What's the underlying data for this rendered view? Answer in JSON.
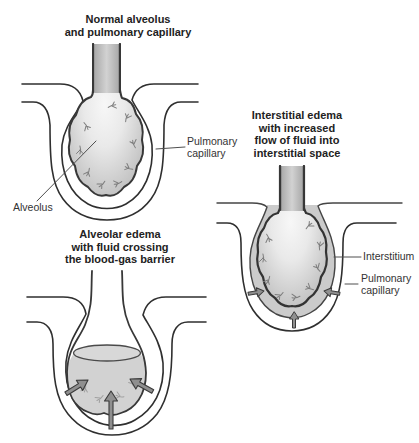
{
  "figure_type": "medical illustration, pulmonary edema stages",
  "colors": {
    "background": "#ffffff",
    "outline": "#333333",
    "title_text": "#222222",
    "label_text": "#333333",
    "alveolus_center": "#f7f7f7",
    "alveolus_edge": "#c2c2c2",
    "stalk_gray": "#b9b9b9",
    "interstitium_fill": "#cbcbcb",
    "fluid_fill": "#d2d2d2",
    "arrow_fill": "#8f8f8f"
  },
  "panels": {
    "normal": {
      "title": "Normal alveolus\nand pulmonary capillary",
      "labels": {
        "alveolus": "Alveolus",
        "pulmonary_capillary": "Pulmonary\ncapillary"
      }
    },
    "interstitial": {
      "title": "Interstitial edema\nwith increased\nflow of fluid into\ninterstitial space",
      "labels": {
        "interstitium": "Interstitium",
        "pulmonary_capillary": "Pulmonary\ncapillary"
      }
    },
    "alveolar": {
      "title": "Alveolar edema\nwith fluid crossing\nthe blood-gas barrier"
    }
  }
}
